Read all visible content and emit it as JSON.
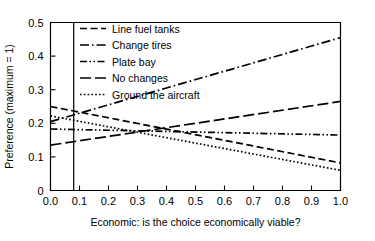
{
  "chart_data": {
    "type": "line",
    "title": "",
    "xlabel": "Economic: is the choice economically viable?",
    "ylabel": "Preference (maximum = 1)",
    "xlim": [
      0.0,
      1.0
    ],
    "ylim": [
      0.0,
      0.5
    ],
    "xticks": [
      "0.0",
      "0.1",
      "0.2",
      "0.3",
      "0.4",
      "0.5",
      "0.6",
      "0.7",
      "0.8",
      "0.9",
      "1.0"
    ],
    "xtick_values": [
      0.0,
      0.1,
      0.2,
      0.3,
      0.4,
      0.5,
      0.6,
      0.7,
      0.8,
      0.9,
      1.0
    ],
    "yticks": [
      "0",
      "0.1",
      "0.2",
      "0.3",
      "0.4",
      "0.5"
    ],
    "ytick_values": [
      0.0,
      0.1,
      0.2,
      0.3,
      0.4,
      0.5
    ],
    "grid": false,
    "legend_position": "upper-left-inside",
    "x": [
      0.0,
      1.0
    ],
    "annotations": [
      {
        "name": "vertical-reference-line",
        "type": "vline",
        "x": 0.08,
        "label": ""
      }
    ],
    "series": [
      {
        "name": "Line fuel tanks",
        "style": "dashed",
        "dasharray": "7,3.5",
        "color": "#000000",
        "x": [
          0.0,
          1.0
        ],
        "values": [
          0.25,
          0.082
        ]
      },
      {
        "name": "Change tires",
        "style": "dash-dot",
        "dasharray": "9,3,1.6,3",
        "color": "#000000",
        "x": [
          0.0,
          1.0
        ],
        "values": [
          0.205,
          0.455
        ]
      },
      {
        "name": "Plate bay",
        "style": "dash-dot-dot",
        "dasharray": "7,2.5,1.5,2.5,1.5,2.5",
        "color": "#000000",
        "x": [
          0.0,
          1.0
        ],
        "values": [
          0.183,
          0.165
        ]
      },
      {
        "name": "No changes",
        "style": "long-dash",
        "dasharray": "11,4",
        "color": "#000000",
        "x": [
          0.0,
          1.0
        ],
        "values": [
          0.135,
          0.265
        ]
      },
      {
        "name": "Ground the aircraft",
        "style": "dotted",
        "dasharray": "1.6,2.2",
        "color": "#000000",
        "x": [
          0.0,
          1.0
        ],
        "values": [
          0.222,
          0.06
        ]
      }
    ]
  },
  "legend": {
    "items": [
      {
        "label": "Line fuel tanks"
      },
      {
        "label": "Change tires"
      },
      {
        "label": "Plate bay"
      },
      {
        "label": "No changes"
      },
      {
        "label": "Ground the aircraft"
      }
    ]
  }
}
